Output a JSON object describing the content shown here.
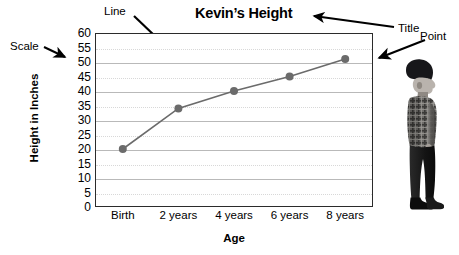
{
  "chart_data": {
    "type": "line",
    "title": "Kevin’s Height",
    "xlabel": "Age",
    "ylabel": "Height in Inches",
    "categories": [
      "Birth",
      "2 years",
      "4 years",
      "6 years",
      "8 years"
    ],
    "values": [
      20,
      34,
      40,
      45,
      51
    ],
    "ylim": [
      0,
      60
    ],
    "ytick_step": 5,
    "yticks": [
      "60",
      "55",
      "50",
      "45",
      "40",
      "35",
      "30",
      "25",
      "20",
      "15",
      "10",
      "5",
      "0"
    ],
    "grid": true,
    "legend": "none",
    "series_color": "#6b6b6b",
    "marker": "circle",
    "annotations": [
      {
        "id": "scale",
        "label": "Scale",
        "points_to": "y-axis-tick-labels"
      },
      {
        "id": "line",
        "label": "Line",
        "points_to": "data-line"
      },
      {
        "id": "title",
        "label": "Title",
        "points_to": "chart-title"
      },
      {
        "id": "point",
        "label": "Point",
        "points_to": "last-data-point"
      }
    ]
  },
  "image": {
    "photo_alt": "boy-standing-profile"
  },
  "colors": {
    "axis": "#2b2b2b",
    "gridline_major": "#b9b9b9",
    "gridline_minor": "#d8d8d8",
    "series": "#6b6b6b",
    "annotation": "#000000",
    "background": "#ffffff"
  }
}
